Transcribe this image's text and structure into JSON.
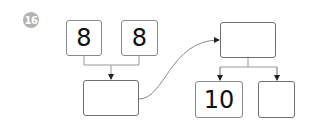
{
  "problem": {
    "number": "16",
    "badge_color": "#b3b3b3"
  },
  "diagram": {
    "inputs": [
      {
        "value": "8"
      },
      {
        "value": "8"
      }
    ],
    "combined": {
      "value": ""
    },
    "target": {
      "value": ""
    },
    "outputs": [
      {
        "value": "10"
      },
      {
        "value": ""
      }
    ]
  }
}
